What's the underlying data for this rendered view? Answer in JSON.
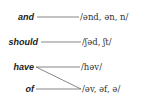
{
  "diagram": {
    "words": [
      {
        "id": "and",
        "label": "and"
      },
      {
        "id": "should",
        "label": "should"
      },
      {
        "id": "have",
        "label": "have"
      },
      {
        "id": "of",
        "label": "of"
      }
    ],
    "pronunciations": [
      {
        "id": "and-weak",
        "label": "/ənd, ən, n/"
      },
      {
        "id": "should-weak",
        "label": "/ʃəd, ʃt/"
      },
      {
        "id": "have-weak",
        "label": "/həv/"
      },
      {
        "id": "of-weak",
        "label": "/əv, əf, ə/"
      }
    ],
    "connections": [
      {
        "from": "and",
        "to": "/ənd, ən, n/"
      },
      {
        "from": "should",
        "to": "/ʃəd, ʃt/"
      },
      {
        "from": "have",
        "to": "/həv/"
      },
      {
        "from": "have",
        "to": "/əv, əf, ə/"
      },
      {
        "from": "of",
        "to": "/əv, əf, ə/"
      }
    ],
    "line_color": "#555555"
  }
}
